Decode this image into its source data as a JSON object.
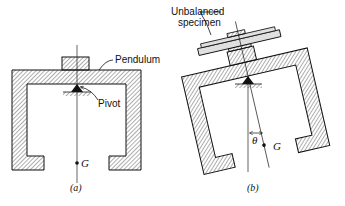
{
  "figure": {
    "panels": [
      {
        "id": "a",
        "caption": "(a)",
        "labels": {
          "pendulum": "Pendulum",
          "pivot": "Pivot",
          "cg": "G"
        },
        "tilt_deg": 0
      },
      {
        "id": "b",
        "caption": "(b)",
        "labels": {
          "specimen_line1": "Unbalanced",
          "specimen_line2": "specimen",
          "angle": "θ",
          "cg": "G"
        },
        "tilt_deg": -13
      }
    ],
    "colors": {
      "ink": "#111111",
      "background": "#ffffff"
    }
  }
}
